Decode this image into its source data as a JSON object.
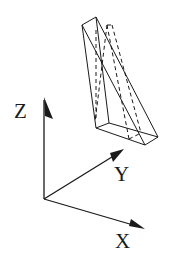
{
  "diagram": {
    "type": "3d-coordinate-axes-with-wedge",
    "axes": {
      "z": {
        "label": "Z"
      },
      "y": {
        "label": "Y"
      },
      "x": {
        "label": "X"
      }
    },
    "object": {
      "name": "triangular wedge prism",
      "hidden_edges": "dashed"
    },
    "colors": {
      "line": "#1a1a1a",
      "background": "#ffffff"
    }
  }
}
